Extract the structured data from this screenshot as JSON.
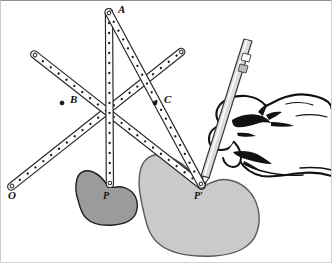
{
  "figure": {
    "background_color": "#ffffff",
    "border_color": "#cfcfcf",
    "width": 332,
    "height": 263
  },
  "labels": {
    "O": "O",
    "A": "A",
    "B": "B",
    "C": "C",
    "P": "P",
    "P_prime": "P′"
  },
  "pivots": [
    {
      "name": "O",
      "label": "O",
      "x": 12,
      "y": 186,
      "role": "fixed-pivot"
    },
    {
      "name": "A",
      "label": "A",
      "x": 109,
      "y": 13,
      "role": "joint"
    },
    {
      "name": "B",
      "label": "B",
      "x": 62,
      "y": 103,
      "role": "crossing-joint"
    },
    {
      "name": "C",
      "label": "C",
      "x": 155,
      "y": 103,
      "role": "crossing-joint"
    },
    {
      "name": "P",
      "label": "P",
      "x": 108,
      "y": 186,
      "role": "tracing-point"
    },
    {
      "name": "P_prime",
      "label": "P′",
      "x": 202,
      "y": 186,
      "role": "drawing-point"
    }
  ],
  "label_positions": [
    {
      "name": "O",
      "x": 8,
      "y": 196
    },
    {
      "name": "A",
      "x": 119,
      "y": 8
    },
    {
      "name": "B",
      "x": 71,
      "y": 98
    },
    {
      "name": "C",
      "x": 166,
      "y": 98
    },
    {
      "name": "P",
      "x": 102,
      "y": 196
    },
    {
      "name": "P_prime",
      "x": 195,
      "y": 196
    }
  ],
  "bars": [
    {
      "name": "bar-O-to-upper-right",
      "from": [
        12,
        186
      ],
      "to": [
        181,
        52
      ],
      "holes": 22
    },
    {
      "name": "bar-upper-left-to-P-prime",
      "from": [
        35,
        55
      ],
      "to": [
        202,
        186
      ],
      "holes": 22
    },
    {
      "name": "bar-A-to-P",
      "from": [
        109,
        13
      ],
      "to": [
        108,
        186
      ],
      "holes": 17
    },
    {
      "name": "bar-A-to-P-prime",
      "from": [
        109,
        13
      ],
      "to": [
        202,
        186
      ],
      "holes": 17
    }
  ],
  "bar_style": {
    "fill": "#ffffff",
    "stroke": "#2a2a2a",
    "hole_color": "#1a1a1a",
    "width_px": 7
  },
  "shapes": [
    {
      "name": "shape-P",
      "label": "P",
      "fill": "#9b9b9b",
      "stroke": "#1f1f1f",
      "description": "small dark gray bean-shaped figure being traced"
    },
    {
      "name": "shape-P-prime",
      "label": "P′",
      "fill": "#cacaca",
      "stroke": "#4d4d4d",
      "description": "large light gray bean-shaped enlarged copy being drawn"
    }
  ],
  "hand": {
    "name": "hand-holding-pencil",
    "outline_color": "#111111",
    "fill": "#ffffff",
    "description": "line-art right hand gripping a pencil at point P′"
  },
  "pencil": {
    "name": "pencil",
    "body_color": "#d8d8d8",
    "outline_color": "#333333",
    "tip_color": "#1a1a1a",
    "tip_x": 202,
    "tip_y": 186,
    "description": "pencil held in hand, tip at P′"
  }
}
